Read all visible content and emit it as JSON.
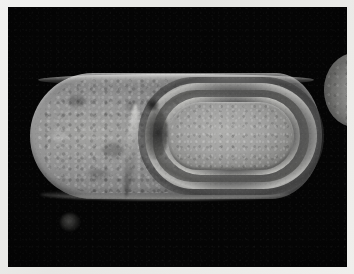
{
  "figure": {
    "kind": "transmission-electron-micrograph",
    "alt_text": "Transmission electron micrograph of a sporulating rod-shaped bacterium containing a mature endospore with concentric coat layers, on a black background with a light photographic border.",
    "background_color": "#050505",
    "border_color": "#eeeeeb",
    "border_width_px": "8"
  },
  "specimen": {
    "main_cell_label": "sporangium (mother cell)",
    "endospore_label": "endospore",
    "spore_core_label": "spore core",
    "cortex_label": "cortex",
    "coat_label": "spore coat",
    "exosporium_label": "exosporium",
    "septum_label": "engulfment septum",
    "neighbor_label": "adjacent cell (partial)",
    "debris_label": "stain debris"
  },
  "tones": {
    "background": "#050505",
    "cytoplasm": "#8e8e8c",
    "spore_core": "#a5a5a3",
    "coat_highlight": "#d8d8d4",
    "cortex_dark": "#4a4a48",
    "paper": "#eeeeeb"
  }
}
